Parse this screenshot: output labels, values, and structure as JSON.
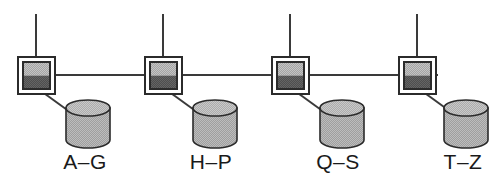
{
  "diagram": {
    "type": "network-topology",
    "bus": {
      "name": "horizontal-bus-line",
      "x1": 18,
      "x2": 438,
      "y": 75,
      "color": "#3a3a3a",
      "width": 2
    },
    "colors": {
      "line": "#3a3a3a",
      "outline": "#2b2b2b",
      "box_top_fill": "#9c9c9c",
      "box_bottom_fill": "#555555",
      "box_gap_fill": "#ffffff",
      "cylinder_body_fill": "#a9a9a9",
      "cylinder_top_fill": "#b8b8b8",
      "label_color": "#1a1a1a",
      "background": "#ffffff"
    },
    "nodes": [
      {
        "id": "server-1",
        "label": "A–G",
        "server": {
          "name": "server-box",
          "x": 18,
          "y": 57,
          "size": 37
        },
        "stem": {
          "name": "uplink-stem",
          "x": 36,
          "y1": 14,
          "y2": 57
        },
        "link": {
          "name": "server-storage-link",
          "x1": 41,
          "y1": 91,
          "x2": 70,
          "y2": 112
        },
        "storage": {
          "name": "database-cylinder",
          "cx": 88,
          "top_y": 108,
          "rx": 22,
          "ry": 8,
          "body_height": 32
        },
        "label_pos": {
          "x": 85,
          "y": 169
        }
      },
      {
        "id": "server-2",
        "label": "H–P",
        "server": {
          "name": "server-box",
          "x": 145,
          "y": 57,
          "size": 37
        },
        "stem": {
          "name": "uplink-stem",
          "x": 163,
          "y1": 14,
          "y2": 57
        },
        "link": {
          "name": "server-storage-link",
          "x1": 168,
          "y1": 91,
          "x2": 197,
          "y2": 112
        },
        "storage": {
          "name": "database-cylinder",
          "cx": 215,
          "top_y": 108,
          "rx": 22,
          "ry": 8,
          "body_height": 32
        },
        "label_pos": {
          "x": 211,
          "y": 169
        }
      },
      {
        "id": "server-3",
        "label": "Q–S",
        "server": {
          "name": "server-box",
          "x": 272,
          "y": 57,
          "size": 37
        },
        "stem": {
          "name": "uplink-stem",
          "x": 290,
          "y1": 14,
          "y2": 57
        },
        "link": {
          "name": "server-storage-link",
          "x1": 295,
          "y1": 91,
          "x2": 324,
          "y2": 112
        },
        "storage": {
          "name": "database-cylinder",
          "cx": 342,
          "top_y": 108,
          "rx": 22,
          "ry": 8,
          "body_height": 32
        },
        "label_pos": {
          "x": 338,
          "y": 169
        }
      },
      {
        "id": "server-4",
        "label": "T–Z",
        "server": {
          "name": "server-box",
          "x": 399,
          "y": 57,
          "size": 37
        },
        "stem": {
          "name": "uplink-stem",
          "x": 417,
          "y1": 14,
          "y2": 57
        },
        "link": {
          "name": "server-storage-link",
          "x1": 422,
          "y1": 91,
          "x2": 451,
          "y2": 112
        },
        "storage": {
          "name": "database-cylinder",
          "cx": 466,
          "top_y": 108,
          "rx": 22,
          "ry": 8,
          "body_height": 32
        },
        "label_pos": {
          "x": 463,
          "y": 169
        }
      }
    ]
  }
}
